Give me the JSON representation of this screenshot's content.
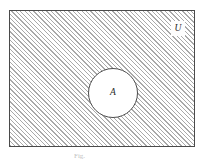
{
  "figure": {
    "kind": "venn-diagram",
    "universe": {
      "label": "U",
      "shape": "rectangle",
      "fill": "hatched",
      "hatch_color": "#a9a9a9",
      "hatch_angle_deg": 45,
      "border_color": "#4a4a4a",
      "background": "#ffffff",
      "bounds": {
        "x": 9,
        "y": 10,
        "width": 186,
        "height": 137
      }
    },
    "set_a": {
      "label": "A",
      "shape": "circle",
      "fill": "#ffffff",
      "border_color": "#4d4d4d",
      "center": {
        "x": 103,
        "y": 82
      },
      "radius": 25
    },
    "caption": "Fig."
  }
}
